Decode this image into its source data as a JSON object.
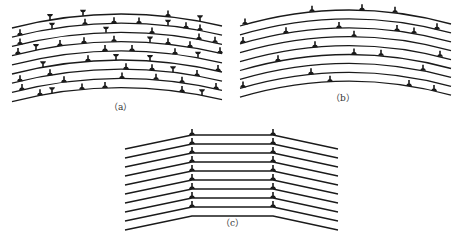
{
  "figure": {
    "panels": [
      {
        "id": "a",
        "label": "（a）",
        "description": "Bent crystal with randomly distributed edge dislocations of both signs",
        "line_count": 9,
        "geometry": {
          "x0": 12,
          "x1": 222,
          "y_left_top": 28,
          "y_peak_top": 14,
          "y_right_top": 26,
          "spacing": 9.2
        }
      },
      {
        "id": "b",
        "label": "（b）",
        "description": "Excess dislocations of one sign distributed along slip planes",
        "line_count": 9,
        "geometry": {
          "x0": 240,
          "x1": 451,
          "y_left_top": 26,
          "y_peak_top": 10,
          "y_right_top": 24,
          "spacing": 8.9
        }
      },
      {
        "id": "c",
        "label": "（c）",
        "description": "Polygonization: dislocations aligned into vertical walls (sub-grain boundaries)",
        "line_count": 9,
        "geometry": {
          "x_left": 125,
          "x_kink_left": 192,
          "x_kink_right": 273,
          "x_right": 338,
          "y_flat_top": 135,
          "spacing": 9.0,
          "slope_drop": 14
        }
      }
    ]
  },
  "colors": {
    "ink": "#1a1a1a",
    "background": "#ffffff",
    "label": "#333333"
  }
}
